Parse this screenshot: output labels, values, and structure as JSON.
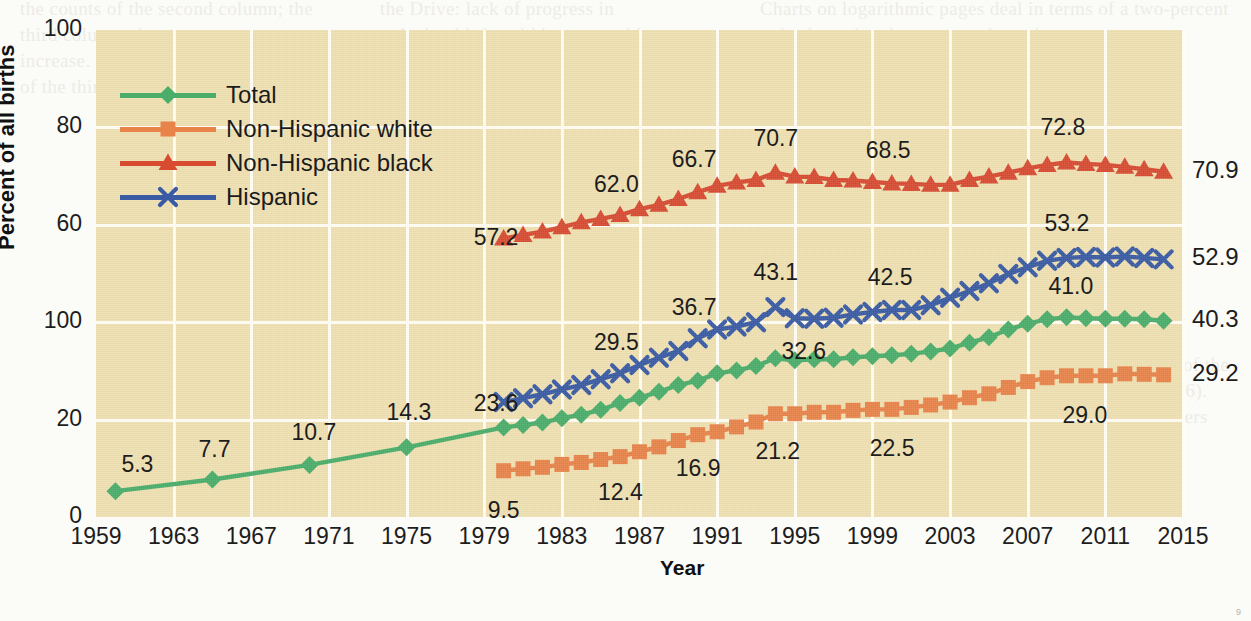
{
  "chart_data": {
    "type": "line",
    "title": "",
    "xlabel": "Year",
    "ylabel": "Percent of all births",
    "xlim": [
      1959,
      2015
    ],
    "ylim": [
      0,
      100
    ],
    "ytick_labels": [
      "100",
      "80",
      "60",
      "100",
      "20",
      "0"
    ],
    "ytick_values": [
      100,
      80,
      60,
      40,
      20,
      0
    ],
    "xtick_labels": [
      "1959",
      "1963",
      "1967",
      "1971",
      "1975",
      "1979",
      "1983",
      "1987",
      "1991",
      "1995",
      "1999",
      "2003",
      "2007",
      "2011",
      "2015"
    ],
    "xtick_values": [
      1959,
      1963,
      1967,
      1971,
      1975,
      1979,
      1983,
      1987,
      1991,
      1995,
      1999,
      2003,
      2007,
      2011,
      2015
    ],
    "grid": true,
    "legend_position": "upper-left",
    "series": [
      {
        "name": "Total",
        "color": "#4aad6a",
        "marker": "diamond",
        "x": [
          1960,
          1965,
          1970,
          1975,
          1980,
          1981,
          1982,
          1983,
          1984,
          1985,
          1986,
          1987,
          1988,
          1989,
          1990,
          1991,
          1992,
          1993,
          1994,
          1995,
          1996,
          1997,
          1998,
          1999,
          2000,
          2001,
          2002,
          2003,
          2004,
          2005,
          2006,
          2007,
          2008,
          2009,
          2010,
          2011,
          2012,
          2013,
          2014
        ],
        "y": [
          5.3,
          7.7,
          10.7,
          14.3,
          18.4,
          18.9,
          19.4,
          20.3,
          21.0,
          22.0,
          23.4,
          24.5,
          25.7,
          27.1,
          28.0,
          29.5,
          30.1,
          31.0,
          32.6,
          32.2,
          32.4,
          32.4,
          32.8,
          33.0,
          33.2,
          33.5,
          34.0,
          34.6,
          35.8,
          36.9,
          38.5,
          39.7,
          40.6,
          41.0,
          40.8,
          40.7,
          40.7,
          40.6,
          40.3
        ]
      },
      {
        "name": "Non-Hispanic white",
        "color": "#e8834a",
        "marker": "square",
        "x": [
          1980,
          1981,
          1982,
          1983,
          1984,
          1985,
          1986,
          1987,
          1988,
          1989,
          1990,
          1991,
          1992,
          1993,
          1994,
          1995,
          1996,
          1997,
          1998,
          1999,
          2000,
          2001,
          2002,
          2003,
          2004,
          2005,
          2006,
          2007,
          2008,
          2009,
          2010,
          2011,
          2012,
          2013,
          2014
        ],
        "y": [
          9.5,
          9.9,
          10.2,
          10.8,
          11.2,
          11.8,
          12.4,
          13.4,
          14.4,
          15.7,
          16.9,
          17.5,
          18.5,
          19.5,
          21.2,
          21.2,
          21.5,
          21.5,
          21.9,
          22.1,
          22.1,
          22.5,
          23.0,
          23.6,
          24.5,
          25.3,
          26.6,
          27.8,
          28.6,
          29.0,
          29.0,
          29.0,
          29.4,
          29.3,
          29.2
        ]
      },
      {
        "name": "Non-Hispanic black",
        "color": "#d74b31",
        "marker": "triangle",
        "x": [
          1980,
          1981,
          1982,
          1983,
          1984,
          1985,
          1986,
          1987,
          1988,
          1989,
          1990,
          1991,
          1992,
          1993,
          1994,
          1995,
          1996,
          1997,
          1998,
          1999,
          2000,
          2001,
          2002,
          2003,
          2004,
          2005,
          2006,
          2007,
          2008,
          2009,
          2010,
          2011,
          2012,
          2013,
          2014
        ],
        "y": [
          57.2,
          57.9,
          58.6,
          59.5,
          60.5,
          61.2,
          62.0,
          63.2,
          64.1,
          65.3,
          66.7,
          68.0,
          68.7,
          69.2,
          70.7,
          69.9,
          69.8,
          69.2,
          69.1,
          68.8,
          68.5,
          68.4,
          68.2,
          68.2,
          69.2,
          69.9,
          70.7,
          71.6,
          72.3,
          72.8,
          72.5,
          72.3,
          71.9,
          71.4,
          70.9
        ]
      },
      {
        "name": "Hispanic",
        "color": "#3a5ba3",
        "marker": "cross",
        "x": [
          1980,
          1981,
          1982,
          1983,
          1984,
          1985,
          1986,
          1987,
          1988,
          1989,
          1990,
          1991,
          1992,
          1993,
          1994,
          1995,
          1996,
          1997,
          1998,
          1999,
          2000,
          2001,
          2002,
          2003,
          2004,
          2005,
          2006,
          2007,
          2008,
          2009,
          2010,
          2011,
          2012,
          2013,
          2014
        ],
        "y": [
          23.6,
          24.4,
          25.2,
          26.2,
          27.1,
          28.3,
          29.5,
          31.2,
          32.7,
          34.1,
          36.7,
          38.5,
          39.1,
          40.0,
          43.1,
          40.8,
          40.7,
          40.9,
          41.6,
          42.1,
          42.5,
          42.5,
          43.5,
          45.0,
          46.4,
          48.0,
          49.9,
          51.3,
          52.6,
          53.2,
          53.4,
          53.3,
          53.5,
          53.2,
          52.9
        ]
      }
    ],
    "data_labels": [
      {
        "series": "Total",
        "year": 1960,
        "value": "5.3"
      },
      {
        "series": "Total",
        "year": 1965,
        "value": "7.7"
      },
      {
        "series": "Total",
        "year": 1970,
        "value": "10.7"
      },
      {
        "series": "Total",
        "year": 1975,
        "value": "14.3"
      },
      {
        "series": "Total",
        "year": 1994,
        "value": "32.6"
      },
      {
        "series": "Total",
        "year": 2009,
        "value": "41.0"
      },
      {
        "series": "Non-Hispanic white",
        "year": 1980,
        "value": "9.5"
      },
      {
        "series": "Non-Hispanic white",
        "year": 1986,
        "value": "12.4"
      },
      {
        "series": "Non-Hispanic white",
        "year": 1990,
        "value": "16.9"
      },
      {
        "series": "Non-Hispanic white",
        "year": 1994,
        "value": "21.2"
      },
      {
        "series": "Non-Hispanic white",
        "year": 2000,
        "value": "22.5"
      },
      {
        "series": "Non-Hispanic white",
        "year": 2009,
        "value": "29.0"
      },
      {
        "series": "Non-Hispanic black",
        "year": 1980,
        "value": "57.2"
      },
      {
        "series": "Non-Hispanic black",
        "year": 1986,
        "value": "62.0"
      },
      {
        "series": "Non-Hispanic black",
        "year": 1990,
        "value": "66.7"
      },
      {
        "series": "Non-Hispanic black",
        "year": 1994,
        "value": "70.7"
      },
      {
        "series": "Non-Hispanic black",
        "year": 2000,
        "value": "68.5"
      },
      {
        "series": "Non-Hispanic black",
        "year": 2009,
        "value": "72.8"
      },
      {
        "series": "Hispanic",
        "year": 1980,
        "value": "23.6"
      },
      {
        "series": "Hispanic",
        "year": 1986,
        "value": "29.5"
      },
      {
        "series": "Hispanic",
        "year": 1990,
        "value": "36.7"
      },
      {
        "series": "Hispanic",
        "year": 1994,
        "value": "43.1"
      },
      {
        "series": "Hispanic",
        "year": 2000,
        "value": "42.5"
      },
      {
        "series": "Hispanic",
        "year": 2009,
        "value": "53.2"
      }
    ],
    "end_labels": [
      {
        "series": "Non-Hispanic black",
        "value": "70.9"
      },
      {
        "series": "Hispanic",
        "value": "52.9"
      },
      {
        "series": "Total",
        "value": "40.3"
      },
      {
        "series": "Non-Hispanic white",
        "value": "29.2"
      }
    ]
  },
  "legend": {
    "items": [
      {
        "label": "Total",
        "color": "#4aad6a",
        "marker": "diamond"
      },
      {
        "label": "Non-Hispanic white",
        "color": "#e8834a",
        "marker": "square"
      },
      {
        "label": "Non-Hispanic black",
        "color": "#d74b31",
        "marker": "triangle"
      },
      {
        "label": "Hispanic",
        "color": "#3a5ba3",
        "marker": "cross"
      }
    ]
  },
  "page": {
    "background_color": "#efe0b0",
    "grid_color": "#fffdf4",
    "page_number": "9",
    "bleed_text_left": "the counts of the second column; the third column gives a percent increase. Inspect the column headers of the third column carefully.",
    "bleed_text_mid": "the Drive: lack of progress in reducing births within partnership contexts of long duration (Nichols 2016). Among teenagers, pregnancy and cohabitation with the partner (Clark 2016).",
    "bleed_text_right": "Charts on logarithmic pages deal in terms of a two-percent point-by-point change over the estimates.",
    "bleed_text_low": "These results, of course, are subject to a number of caveats, the least of which is that a large number of women were either unmarried or married at the time of the birth, and this is reflected in the estimates (Clark 2016). Among two-parent births to Mexican American mothers and mothers both"
  }
}
